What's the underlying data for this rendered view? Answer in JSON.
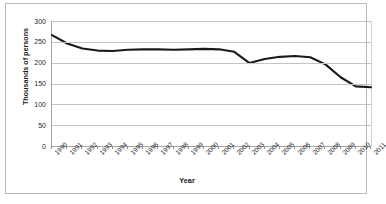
{
  "chart_data": {
    "type": "line",
    "title": "",
    "xlabel": "Year",
    "ylabel": "Thousands of persons",
    "x": [
      1990,
      1991,
      1992,
      1993,
      1994,
      1995,
      1996,
      1997,
      1998,
      1999,
      2000,
      2001,
      2002,
      2003,
      2004,
      2005,
      2006,
      2007,
      2008,
      2009,
      2010,
      2011
    ],
    "categories": [
      "1990",
      "1991",
      "1992",
      "1993",
      "1994",
      "1995",
      "1996",
      "1997",
      "1998",
      "1999",
      "2000",
      "2001",
      "2002",
      "2003",
      "2004",
      "2005",
      "2006",
      "2007",
      "2008",
      "2009",
      "2010",
      "2011"
    ],
    "values": [
      266,
      246,
      234,
      229,
      228,
      231,
      232,
      232,
      231,
      232,
      233,
      232,
      226,
      199,
      209,
      214,
      216,
      213,
      196,
      165,
      143,
      141
    ],
    "series": [
      {
        "name": "Thousands of persons",
        "values": [
          266,
          246,
          234,
          229,
          228,
          231,
          232,
          232,
          231,
          232,
          233,
          232,
          226,
          199,
          209,
          214,
          216,
          213,
          196,
          165,
          143,
          141
        ]
      }
    ],
    "xlim": [
      1990,
      2011
    ],
    "ylim": [
      0,
      300
    ],
    "yticks": [
      0,
      50,
      100,
      150,
      200,
      250,
      300
    ],
    "ytick_labels": [
      "0",
      "50",
      "100",
      "150",
      "200",
      "250",
      "300"
    ],
    "grid": "horizontal",
    "legend": "none",
    "line_color": "#1a1a1a",
    "gridline_color": "#c4c4c4",
    "background": "#ffffff"
  },
  "axes": {
    "y_title": "Thousands of persons",
    "x_title": "Year"
  }
}
